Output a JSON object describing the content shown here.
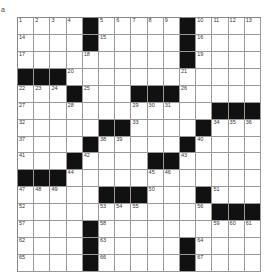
{
  "figure_label": "a",
  "puzzle": {
    "rows": 15,
    "cols": 15,
    "grid": [
      [
        "1",
        "2",
        "3",
        "4",
        "#",
        "5",
        "6",
        "7",
        "8",
        "9",
        "#",
        "10",
        "11",
        "12",
        "13"
      ],
      [
        "14",
        "",
        "",
        "",
        "#",
        "15",
        "",
        "",
        "",
        "",
        "#",
        "16",
        "",
        "",
        ""
      ],
      [
        "17",
        "",
        "",
        "",
        "18",
        "",
        "",
        "",
        "",
        "",
        "#",
        "19",
        "",
        "",
        ""
      ],
      [
        "#",
        "#",
        "#",
        "20",
        "",
        "",
        "",
        "",
        "",
        "",
        "21",
        "",
        "",
        "",
        ""
      ],
      [
        "22",
        "23",
        "24",
        "#",
        "25",
        "",
        "",
        "#",
        "#",
        "#",
        "26",
        "",
        "",
        "",
        ""
      ],
      [
        "27",
        "",
        "",
        "28",
        "",
        "",
        "",
        "29",
        "30",
        "31",
        "",
        "",
        "#",
        "#",
        "#"
      ],
      [
        "32",
        "",
        "",
        "",
        "",
        "#",
        "#",
        "33",
        "",
        "",
        "",
        "#",
        "34",
        "35",
        "36"
      ],
      [
        "37",
        "",
        "",
        "",
        "#",
        "38",
        "39",
        "",
        "",
        "",
        "#",
        "40",
        "",
        "",
        ""
      ],
      [
        "41",
        "",
        "",
        "#",
        "42",
        "",
        "",
        "",
        "#",
        "#",
        "43",
        "",
        "",
        "",
        ""
      ],
      [
        "#",
        "#",
        "#",
        "44",
        "",
        "",
        "",
        "",
        "45",
        "46",
        "",
        "",
        "",
        "",
        ""
      ],
      [
        "47",
        "48",
        "49",
        "",
        "",
        "#",
        "#",
        "#",
        "50",
        "",
        "",
        "#",
        "51",
        "",
        ""
      ],
      [
        "52",
        "",
        "",
        "",
        "",
        "53",
        "54",
        "55",
        "",
        "",
        "",
        "56",
        "#",
        "#",
        "#"
      ],
      [
        "57",
        "",
        "",
        "",
        "#",
        "58",
        "",
        "",
        "",
        "",
        "",
        "",
        "59",
        "60",
        "61"
      ],
      [
        "62",
        "",
        "",
        "",
        "#",
        "63",
        "",
        "",
        "",
        "",
        "#",
        "64",
        "",
        "",
        ""
      ],
      [
        "65",
        "",
        "",
        "",
        "#",
        "66",
        "",
        "",
        "",
        "",
        "#",
        "67",
        "",
        "",
        ""
      ]
    ]
  }
}
